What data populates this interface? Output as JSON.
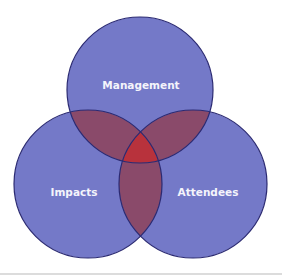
{
  "diagram": {
    "type": "venn-3",
    "circles": [
      {
        "id": "management",
        "label": "Management",
        "cx": 140,
        "cy": 90,
        "r": 73
      },
      {
        "id": "impacts",
        "label": "Impacts",
        "cx": 88,
        "cy": 184,
        "r": 74
      },
      {
        "id": "attendees",
        "label": "Attendees",
        "cx": 193,
        "cy": 184,
        "r": 74
      }
    ],
    "colors": {
      "circle_fill": "#7479c8",
      "circle_stroke": "#2b2a72",
      "pair_overlap": "#8a4a6a",
      "center_overlap": "#b8323c",
      "label": "#f4f4fb"
    }
  }
}
